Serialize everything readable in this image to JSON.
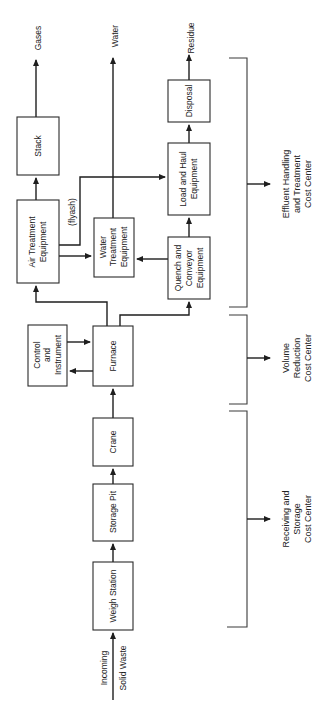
{
  "diagram": {
    "orientation": "rotated-90-ccw",
    "input": {
      "line1": "Incoming",
      "line2": "Solid Waste"
    },
    "boxes": {
      "weigh_station": {
        "label": "Weigh Station"
      },
      "storage_pit": {
        "label": "Storage Pit"
      },
      "crane": {
        "label": "Crane"
      },
      "furnace": {
        "label": "Furnace"
      },
      "control": {
        "line1": "Control",
        "line2": "and",
        "line3": "Instrument"
      },
      "air_treatment": {
        "line1": "Air Treatment",
        "line2": "Equipment"
      },
      "stack": {
        "label": "Stack"
      },
      "water_treatment": {
        "line1": "Water",
        "line2": "Treatment",
        "line3": "Equipment"
      },
      "quench": {
        "line1": "Quench and",
        "line2": "Conveyor",
        "line3": "Equipment"
      },
      "load_haul": {
        "line1": "Load and Haul",
        "line2": "Equipment"
      },
      "disposal": {
        "label": "Disposal"
      }
    },
    "outputs": {
      "gases": "Gases",
      "water": "Water",
      "residue": "Residue"
    },
    "flow_label": "(flyash)",
    "cost_centers": {
      "receiving": {
        "line1": "Receiving and",
        "line2": "Storage",
        "line3": "Cost Center"
      },
      "volume": {
        "line1": "Volume",
        "line2": "Reduction",
        "line3": "Cost Center"
      },
      "effluent": {
        "line1": "Effluent Handling",
        "line2": "and Treatment",
        "line3": "Cost Center"
      }
    }
  }
}
